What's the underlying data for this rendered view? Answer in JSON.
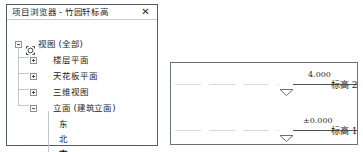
{
  "browser": {
    "title": "项目浏览器 - 竹园轩标高",
    "close_label": "✕",
    "close_icon": "close-icon",
    "tree": [
      {
        "label": "视图 (全部)",
        "depth": 0,
        "expander": "minus",
        "icon": "views-icon",
        "selected": false,
        "top": 17
      },
      {
        "label": "楼层平面",
        "depth": 1,
        "expander": "plus",
        "icon": "",
        "selected": false,
        "top": 33
      },
      {
        "label": "天花板平面",
        "depth": 1,
        "expander": "plus",
        "icon": "",
        "selected": false,
        "top": 49
      },
      {
        "label": "三维视图",
        "depth": 1,
        "expander": "plus",
        "icon": "",
        "selected": false,
        "top": 65
      },
      {
        "label": "立面 (建筑立面)",
        "depth": 1,
        "expander": "minus",
        "icon": "",
        "selected": false,
        "top": 81
      },
      {
        "label": "东",
        "depth": 2,
        "expander": "",
        "icon": "",
        "selected": false,
        "top": 97
      },
      {
        "label": "北",
        "depth": 2,
        "expander": "",
        "icon": "",
        "selected": false,
        "top": 112
      },
      {
        "label": "南",
        "depth": 2,
        "expander": "",
        "icon": "",
        "selected": true,
        "top": 127
      },
      {
        "label": "西",
        "depth": 2,
        "expander": "",
        "icon": "",
        "selected": false,
        "top": 142
      }
    ]
  },
  "elevation": {
    "levels": [
      {
        "name": "标高 2",
        "elevation": "4.000",
        "line_y": 21,
        "text_y": 7,
        "name_y": 16
      },
      {
        "name": "标高 1",
        "elevation": "±0.000",
        "line_y": 67,
        "text_y": 53,
        "name_y": 62
      }
    ]
  },
  "colors": {
    "panel_border": "#555a5e",
    "view_border": "#6b7073",
    "text": "#1d1d1d",
    "datum_faint": "#d7dadc",
    "datum_solid": "#4d5255",
    "background": "#ffffff"
  }
}
